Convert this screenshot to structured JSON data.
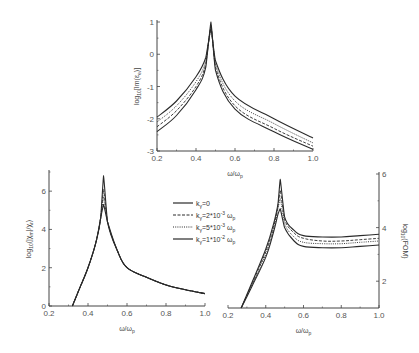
{
  "chart_data": [
    {
      "type": "line",
      "name": "top-chart",
      "title": "",
      "xlabel": "ω/ω_p",
      "ylabel": "log10[Im(ε_e)]",
      "xlim": [
        0.2,
        1.0
      ],
      "ylim": [
        -3,
        1
      ],
      "xticks": [
        "0.2",
        "0.4",
        "0.6",
        "0.8",
        "1.0"
      ],
      "yticks": [
        "-3",
        "-2",
        "-1",
        "0",
        "1"
      ],
      "grid": false,
      "peak_x": 0.477,
      "series": [
        {
          "name": "k_γ=0",
          "style": "solid",
          "x": [
            0.2,
            0.3,
            0.4,
            0.45,
            0.477,
            0.5,
            0.6,
            0.8,
            1.0
          ],
          "values": [
            -2.4,
            -1.9,
            -1.1,
            -0.4,
            1.0,
            -0.5,
            -1.7,
            -2.4,
            -2.95
          ]
        },
        {
          "name": "k_γ=2*10^-3 ω_p",
          "style": "dashed",
          "x": [
            0.2,
            0.3,
            0.4,
            0.45,
            0.477,
            0.5,
            0.6,
            0.8,
            1.0
          ],
          "values": [
            -2.25,
            -1.75,
            -1.0,
            -0.3,
            0.9,
            -0.4,
            -1.6,
            -2.3,
            -2.85
          ]
        },
        {
          "name": "k_γ=5*10^-3 ω_p",
          "style": "dotted",
          "x": [
            0.2,
            0.3,
            0.4,
            0.45,
            0.477,
            0.5,
            0.6,
            0.8,
            1.0
          ],
          "values": [
            -2.1,
            -1.6,
            -0.85,
            -0.2,
            0.85,
            -0.3,
            -1.45,
            -2.15,
            -2.75
          ]
        },
        {
          "name": "k_γ=1*10^-2 ω_p",
          "style": "solid",
          "x": [
            0.2,
            0.3,
            0.4,
            0.45,
            0.477,
            0.5,
            0.6,
            0.8,
            1.0
          ],
          "values": [
            -1.95,
            -1.45,
            -0.7,
            -0.1,
            0.8,
            -0.2,
            -1.3,
            -2.0,
            -2.6
          ]
        }
      ]
    },
    {
      "type": "line",
      "name": "bottom-left-chart",
      "title": "",
      "xlabel": "ω/ω_p",
      "ylabel": "log10(|χ_m|/χ_r)",
      "xlim": [
        0.2,
        1.0
      ],
      "ylim": [
        0,
        7
      ],
      "xticks": [
        "0.2",
        "0.4",
        "0.6",
        "0.8",
        "1.0"
      ],
      "yticks": [
        "0",
        "2",
        "4",
        "6"
      ],
      "grid": false,
      "series": [
        {
          "name": "k_γ=0",
          "style": "solid",
          "x": [
            0.32,
            0.36,
            0.4,
            0.44,
            0.465,
            0.48,
            0.5,
            0.55,
            0.6,
            0.7,
            0.8,
            0.9,
            1.0
          ],
          "values": [
            0,
            1.0,
            2.0,
            3.3,
            4.6,
            6.8,
            4.4,
            2.9,
            2.0,
            1.5,
            1.1,
            0.85,
            0.65
          ]
        },
        {
          "name": "k_γ=2*10^-3 ω_p",
          "style": "dashed",
          "x": [
            0.32,
            0.36,
            0.4,
            0.44,
            0.465,
            0.48,
            0.5,
            0.55,
            0.6,
            0.7,
            0.8,
            0.9,
            1.0
          ],
          "values": [
            0,
            1.0,
            2.0,
            3.3,
            4.6,
            6.1,
            4.4,
            2.9,
            2.0,
            1.5,
            1.1,
            0.85,
            0.65
          ]
        },
        {
          "name": "k_γ=5*10^-3 ω_p",
          "style": "dotted",
          "x": [
            0.32,
            0.36,
            0.4,
            0.44,
            0.465,
            0.48,
            0.5,
            0.55,
            0.6,
            0.7,
            0.8,
            0.9,
            1.0
          ],
          "values": [
            0,
            1.0,
            2.0,
            3.3,
            4.6,
            5.7,
            4.4,
            2.9,
            2.0,
            1.5,
            1.1,
            0.85,
            0.65
          ]
        },
        {
          "name": "k_γ=1*10^-2 ω_p",
          "style": "solid",
          "x": [
            0.32,
            0.36,
            0.4,
            0.44,
            0.465,
            0.48,
            0.5,
            0.55,
            0.6,
            0.7,
            0.8,
            0.9,
            1.0
          ],
          "values": [
            0,
            1.0,
            2.0,
            3.3,
            4.6,
            5.3,
            4.4,
            2.9,
            2.0,
            1.5,
            1.1,
            0.85,
            0.65
          ]
        }
      ]
    },
    {
      "type": "line",
      "name": "bottom-right-chart",
      "title": "",
      "xlabel": "ω/ω_p",
      "ylabel": "log10(FOM)",
      "ylabel_side": "right",
      "xlim": [
        0.2,
        1.0
      ],
      "ylim": [
        1,
        6
      ],
      "xticks": [
        "0.2",
        "0.4",
        "0.6",
        "0.8",
        "1.0"
      ],
      "yticks": [
        "2",
        "4",
        "6"
      ],
      "grid": false,
      "series": [
        {
          "name": "k_γ=0",
          "style": "solid",
          "x": [
            0.27,
            0.33,
            0.4,
            0.44,
            0.465,
            0.477,
            0.5,
            0.55,
            0.6,
            0.7,
            0.8,
            0.9,
            1.0
          ],
          "values": [
            1.0,
            2.0,
            3.2,
            4.1,
            4.9,
            5.8,
            4.4,
            3.9,
            3.7,
            3.65,
            3.65,
            3.7,
            3.75
          ]
        },
        {
          "name": "k_γ=2*10^-3 ω_p",
          "style": "dashed",
          "x": [
            0.27,
            0.33,
            0.4,
            0.44,
            0.465,
            0.477,
            0.5,
            0.55,
            0.6,
            0.7,
            0.8,
            0.9,
            1.0
          ],
          "values": [
            1.0,
            1.95,
            3.1,
            4.0,
            4.8,
            5.4,
            4.3,
            3.8,
            3.6,
            3.5,
            3.5,
            3.55,
            3.6
          ]
        },
        {
          "name": "k_γ=5*10^-3 ω_p",
          "style": "dotted",
          "x": [
            0.27,
            0.33,
            0.4,
            0.44,
            0.465,
            0.477,
            0.5,
            0.55,
            0.6,
            0.7,
            0.8,
            0.9,
            1.0
          ],
          "values": [
            1.0,
            1.9,
            3.0,
            3.9,
            4.7,
            5.1,
            4.15,
            3.65,
            3.45,
            3.4,
            3.4,
            3.45,
            3.5
          ]
        },
        {
          "name": "k_γ=1*10^-2 ω_p",
          "style": "solid",
          "x": [
            0.27,
            0.33,
            0.4,
            0.44,
            0.465,
            0.477,
            0.5,
            0.55,
            0.6,
            0.7,
            0.8,
            0.9,
            1.0
          ],
          "values": [
            1.0,
            1.85,
            2.9,
            3.8,
            4.5,
            4.7,
            4.0,
            3.5,
            3.3,
            3.25,
            3.25,
            3.3,
            3.35
          ]
        }
      ]
    }
  ],
  "legend": {
    "items": [
      {
        "label": "k_γ=0",
        "style": "solid"
      },
      {
        "label": "k_γ=2*10^-3 ω_p",
        "style": "dashed"
      },
      {
        "label": "k_γ=5*10^-3 ω_p",
        "style": "dotted"
      },
      {
        "label": "k_γ=1*10^-2 ω_p",
        "style": "solid"
      }
    ]
  },
  "layout": {
    "line_color": "#2a2a2a",
    "axis_color": "#444444",
    "panels": [
      {
        "x0": 157,
        "x1": 313,
        "y0": 151,
        "y1": 22,
        "yaxis": "left"
      },
      {
        "x0": 49,
        "x1": 205,
        "y0": 306,
        "y1": 172,
        "yaxis": "left"
      },
      {
        "x0": 228,
        "x1": 379,
        "y0": 308,
        "y1": 174,
        "yaxis": "right"
      }
    ]
  }
}
